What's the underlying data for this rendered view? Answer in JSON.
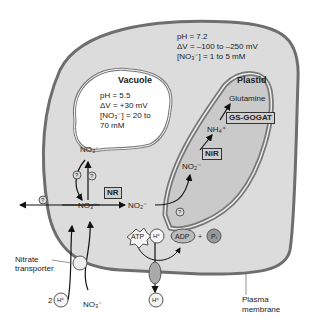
{
  "cytosol": {
    "ph": "pH = 7.2",
    "voltage": "ΔV = –100 to –250 mV",
    "nitrate_conc": "[NO₃⁻] = 1 to 5 mM"
  },
  "vacuole": {
    "title": "Vacuole",
    "ph": "pH = 5.5",
    "voltage": "ΔV = +30 mV",
    "nitrate_conc_line1": "[NO₃⁻] = 20 to",
    "nitrate_conc_line2": "70 mM",
    "nitrate": "NO₃⁻",
    "unknown_transporter": "?"
  },
  "plastid": {
    "title": "Plastid",
    "product": "Glutamine",
    "enzyme_gs": "GS-GOGAT",
    "ammonium": "NH₄⁺",
    "enzyme_nir": "NiR",
    "nitrite": "NO₂⁻"
  },
  "cytosol_pathway": {
    "nitrate": "NO₃⁻",
    "enzyme_nr": "NR",
    "nitrite": "NO₂⁻"
  },
  "pump": {
    "atp": "ATP",
    "proton_in": "H⁺",
    "adp": "ADP",
    "plus": "+",
    "pi": "Pᵢ",
    "proton_out": "H⁺"
  },
  "transporter": {
    "label_line1": "Nitrate",
    "label_line2": "transporter",
    "proton_count": "2",
    "proton": "H⁺",
    "nitrate_ext": "NO₃⁻"
  },
  "membrane": {
    "label_line1": "Plasma",
    "label_line2": "membrane"
  },
  "colors": {
    "cell_fill": "#dcdcdc",
    "membrane": "#6e6e6e",
    "vacuole_fill": "#ffffff",
    "plastid_fill": "#cacaca",
    "enzyme_box": "#cfcfcf"
  }
}
